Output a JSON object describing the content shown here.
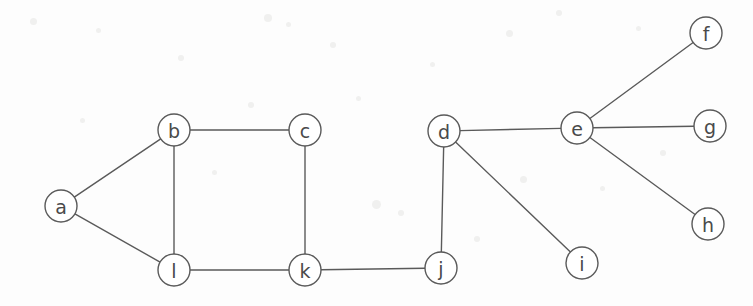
{
  "diagram": {
    "width": 753,
    "height": 306,
    "background_color": "#fdfdfd",
    "stroke_color": "#5a5a5a",
    "node_fill_color": "#ffffff",
    "label_color": "#4a4a4a",
    "node_radius": 16,
    "nodes": [
      {
        "id": "a",
        "label": "a",
        "x": 61,
        "y": 206
      },
      {
        "id": "b",
        "label": "b",
        "x": 174,
        "y": 130
      },
      {
        "id": "c",
        "label": "c",
        "x": 305,
        "y": 130
      },
      {
        "id": "d",
        "label": "d",
        "x": 444,
        "y": 131
      },
      {
        "id": "e",
        "label": "e",
        "x": 577,
        "y": 128
      },
      {
        "id": "f",
        "label": "f",
        "x": 706,
        "y": 33
      },
      {
        "id": "g",
        "label": "g",
        "x": 710,
        "y": 126
      },
      {
        "id": "h",
        "label": "h",
        "x": 708,
        "y": 224
      },
      {
        "id": "i",
        "label": "i",
        "x": 582,
        "y": 263
      },
      {
        "id": "j",
        "label": "j",
        "x": 441,
        "y": 268
      },
      {
        "id": "k",
        "label": "k",
        "x": 305,
        "y": 270
      },
      {
        "id": "l",
        "label": "l",
        "x": 174,
        "y": 270
      }
    ],
    "edges": [
      {
        "from": "a",
        "to": "b"
      },
      {
        "from": "a",
        "to": "l"
      },
      {
        "from": "b",
        "to": "c"
      },
      {
        "from": "b",
        "to": "l"
      },
      {
        "from": "c",
        "to": "k"
      },
      {
        "from": "l",
        "to": "k"
      },
      {
        "from": "k",
        "to": "j"
      },
      {
        "from": "j",
        "to": "d"
      },
      {
        "from": "d",
        "to": "e"
      },
      {
        "from": "d",
        "to": "i"
      },
      {
        "from": "e",
        "to": "f"
      },
      {
        "from": "e",
        "to": "g"
      },
      {
        "from": "e",
        "to": "h"
      }
    ],
    "specks": [
      {
        "x": 30,
        "y": 18,
        "size": 7
      },
      {
        "x": 96,
        "y": 28,
        "size": 5
      },
      {
        "x": 178,
        "y": 55,
        "size": 6
      },
      {
        "x": 264,
        "y": 14,
        "size": 8
      },
      {
        "x": 286,
        "y": 22,
        "size": 5
      },
      {
        "x": 330,
        "y": 42,
        "size": 6
      },
      {
        "x": 372,
        "y": 200,
        "size": 9
      },
      {
        "x": 398,
        "y": 210,
        "size": 6
      },
      {
        "x": 430,
        "y": 62,
        "size": 5
      },
      {
        "x": 506,
        "y": 30,
        "size": 7
      },
      {
        "x": 556,
        "y": 10,
        "size": 6
      },
      {
        "x": 636,
        "y": 26,
        "size": 5
      },
      {
        "x": 248,
        "y": 102,
        "size": 6
      },
      {
        "x": 356,
        "y": 96,
        "size": 5
      },
      {
        "x": 520,
        "y": 176,
        "size": 7
      },
      {
        "x": 600,
        "y": 186,
        "size": 5
      },
      {
        "x": 212,
        "y": 170,
        "size": 5
      },
      {
        "x": 660,
        "y": 150,
        "size": 6
      },
      {
        "x": 80,
        "y": 118,
        "size": 5
      },
      {
        "x": 474,
        "y": 236,
        "size": 6
      }
    ]
  }
}
